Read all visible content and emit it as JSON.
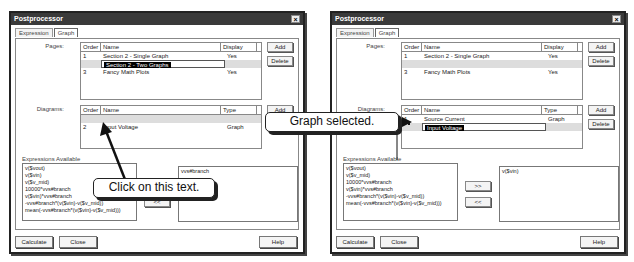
{
  "dialogs": [
    {
      "title": "Postprocessor",
      "tabs": [
        "Expression",
        "Graph"
      ],
      "active_tab": "Graph",
      "pages_label": "Pages:",
      "pages_headers": [
        "Order",
        "Name",
        "Display"
      ],
      "pages_rows": [
        {
          "order": "1",
          "name": "Section 2 - Single Graph",
          "display": "Yes"
        },
        {
          "order": "",
          "name": "Section 2 - Two Graphs",
          "display": "",
          "editing": true
        },
        {
          "order": "3",
          "name": "Fancy Math Plots",
          "display": "Yes"
        }
      ],
      "diagrams_label": "Diagrams:",
      "diagrams_headers": [
        "Order",
        "Name",
        "Type"
      ],
      "diagrams_rows": [
        {
          "order": "",
          "name": "",
          "type": "",
          "selected": true
        },
        {
          "order": "2",
          "name": "Input Voltage",
          "type": "Graph"
        }
      ],
      "expressions_label": "Expressions Available",
      "expressions": [
        "v($vout)",
        "v($vin)",
        "v($v_mid)",
        "10000*vvs#branch",
        "v($vin)*vvs#branch",
        "-vvs#branch*(v($vin)-v($v_mid))",
        "mean(-vvs#branch*(v($vin)-v($v_mid)))"
      ],
      "selected_expressions": [
        "vvs#branch"
      ],
      "buttons": {
        "add": "Add",
        "delete": "Delete",
        "move_right": ">>",
        "move_left": "<<",
        "calculate": "Calculate",
        "close": "Close",
        "help": "Help"
      }
    },
    {
      "title": "Postprocessor",
      "tabs": [
        "Expression",
        "Graph"
      ],
      "active_tab": "Graph",
      "pages_label": "Pages:",
      "pages_headers": [
        "Order",
        "Name",
        "Display"
      ],
      "pages_rows": [
        {
          "order": "1",
          "name": "Section 2 - Single Graph",
          "display": "Yes"
        },
        {
          "order": "",
          "name": "",
          "display": "",
          "selected": true
        },
        {
          "order": "3",
          "name": "Fancy Math Plots",
          "display": "Yes"
        }
      ],
      "diagrams_label": "Diagrams:",
      "diagrams_headers": [
        "Order",
        "Name",
        "Type"
      ],
      "diagrams_rows": [
        {
          "order": "1",
          "name": "Source Current",
          "type": "Graph"
        },
        {
          "order": "",
          "name": "Input Voltage",
          "type": "",
          "editing": true
        }
      ],
      "expressions_label": "Expressions Available",
      "expressions": [
        "v($vout)",
        "v($v_mid)",
        "10000*vvs#branch",
        "v($vin)*vvs#branch",
        "-vvs#branch*(v($vin)-v($v_mid))",
        "mean(-vvs#branch*(v($vin)-v($v_mid)))"
      ],
      "selected_expressions": [
        "v($vin)"
      ],
      "buttons": {
        "add": "Add",
        "delete": "Delete",
        "move_right": ">>",
        "move_left": "<<",
        "calculate": "Calculate",
        "close": "Close",
        "help": "Help"
      }
    }
  ],
  "callouts": {
    "click_text": "Click on this text.",
    "graph_selected": "Graph selected."
  }
}
